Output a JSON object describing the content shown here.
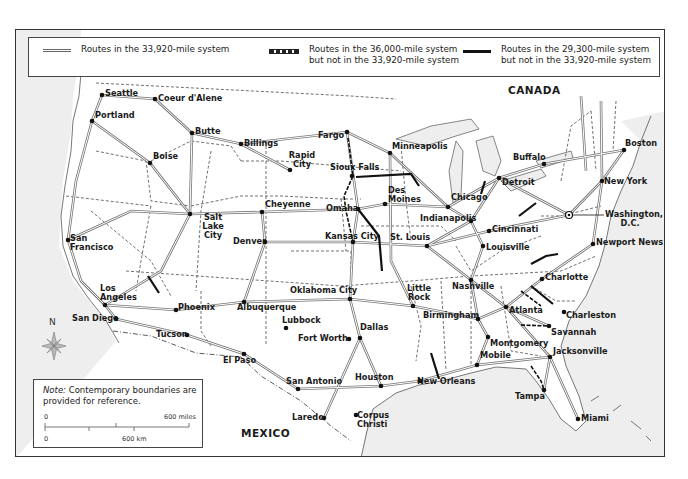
{
  "legend": {
    "items": [
      {
        "style": "double-line",
        "label_line1": "Routes in the 33,920-mile system",
        "label_line2": ""
      },
      {
        "style": "dashed-line",
        "label_line1": "Routes in the 36,000-mile system",
        "label_line2": "but not in the 33,920-mile system"
      },
      {
        "style": "solid-thick-line",
        "label_line1": "Routes in the 29,300-mile system",
        "label_line2": "but not in the 33,920-mile system"
      }
    ]
  },
  "countries": {
    "canada": "CANADA",
    "mexico": "MEXICO"
  },
  "cities": [
    {
      "name": "Seattle",
      "x": 101,
      "y": 94
    },
    {
      "name": "Coeur d'Alene",
      "x": 154,
      "y": 98
    },
    {
      "name": "Portland",
      "x": 91,
      "y": 120
    },
    {
      "name": "Butte",
      "x": 191,
      "y": 132
    },
    {
      "name": "Billings",
      "x": 240,
      "y": 143
    },
    {
      "name": "Boise",
      "x": 149,
      "y": 162
    },
    {
      "name": "Fargo",
      "x": 346,
      "y": 131
    },
    {
      "name": "Minneapolis",
      "x": 389,
      "y": 152
    },
    {
      "name": "Rapid City",
      "x": 289,
      "y": 169
    },
    {
      "name": "Sioux Falls",
      "x": 351,
      "y": 175
    },
    {
      "name": "Des Moines",
      "x": 384,
      "y": 203
    },
    {
      "name": "Omaha",
      "x": 357,
      "y": 208
    },
    {
      "name": "Chicago",
      "x": 447,
      "y": 206
    },
    {
      "name": "Detroit",
      "x": 498,
      "y": 177
    },
    {
      "name": "Buffalo",
      "x": 543,
      "y": 163
    },
    {
      "name": "Boston",
      "x": 623,
      "y": 149
    },
    {
      "name": "New York",
      "x": 601,
      "y": 180
    },
    {
      "name": "Washington, D.C.",
      "x": 568,
      "y": 214
    },
    {
      "name": "Cheyenne",
      "x": 261,
      "y": 211
    },
    {
      "name": "Salt Lake City",
      "x": 189,
      "y": 213
    },
    {
      "name": "San Francisco",
      "x": 67,
      "y": 239
    },
    {
      "name": "Denver",
      "x": 264,
      "y": 241
    },
    {
      "name": "Kansas City",
      "x": 352,
      "y": 241
    },
    {
      "name": "St. Louis",
      "x": 426,
      "y": 245
    },
    {
      "name": "Indianapolis",
      "x": 470,
      "y": 220
    },
    {
      "name": "Cincinnati",
      "x": 488,
      "y": 230
    },
    {
      "name": "Louisville",
      "x": 482,
      "y": 245
    },
    {
      "name": "Newport News",
      "x": 592,
      "y": 243
    },
    {
      "name": "Los Angeles",
      "x": 104,
      "y": 304
    },
    {
      "name": "Phoenix",
      "x": 175,
      "y": 309
    },
    {
      "name": "Albuquerque",
      "x": 243,
      "y": 301
    },
    {
      "name": "Oklahoma City",
      "x": 349,
      "y": 298
    },
    {
      "name": "Little Rock",
      "x": 412,
      "y": 305
    },
    {
      "name": "Nashville",
      "x": 470,
      "y": 279
    },
    {
      "name": "Charlotte",
      "x": 541,
      "y": 278
    },
    {
      "name": "Birmingham",
      "x": 477,
      "y": 318
    },
    {
      "name": "Atlanta",
      "x": 505,
      "y": 306
    },
    {
      "name": "Charleston",
      "x": 563,
      "y": 311
    },
    {
      "name": "San Diego",
      "x": 115,
      "y": 318
    },
    {
      "name": "Tucson",
      "x": 186,
      "y": 334
    },
    {
      "name": "Lubbock",
      "x": 285,
      "y": 327
    },
    {
      "name": "Fort Worth",
      "x": 348,
      "y": 338
    },
    {
      "name": "Dallas",
      "x": 359,
      "y": 337
    },
    {
      "name": "Montgomery",
      "x": 487,
      "y": 336
    },
    {
      "name": "Savannah",
      "x": 548,
      "y": 325
    },
    {
      "name": "Jacksonville",
      "x": 549,
      "y": 356
    },
    {
      "name": "Mobile",
      "x": 476,
      "y": 364
    },
    {
      "name": "El Paso",
      "x": 243,
      "y": 353
    },
    {
      "name": "San Antonio",
      "x": 297,
      "y": 388
    },
    {
      "name": "Houston",
      "x": 380,
      "y": 385
    },
    {
      "name": "New Orleans",
      "x": 419,
      "y": 380
    },
    {
      "name": "Tampa",
      "x": 543,
      "y": 389
    },
    {
      "name": "Laredo",
      "x": 323,
      "y": 417
    },
    {
      "name": "Corpus Christi",
      "x": 355,
      "y": 414
    },
    {
      "name": "Miami",
      "x": 577,
      "y": 418
    }
  ],
  "note": {
    "label": "Note:",
    "text": " Contemporary boundaries are provided for reference."
  },
  "scale": {
    "miles_zero": "0",
    "miles_label": "600 miles",
    "km_zero": "0",
    "km_label": "600 km"
  },
  "compass": {
    "north_label": "N"
  }
}
